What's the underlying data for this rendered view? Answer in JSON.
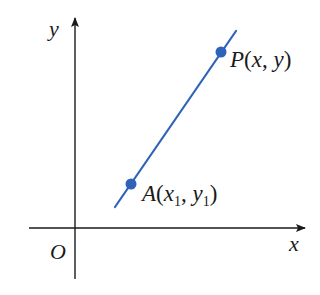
{
  "diagram": {
    "type": "coordinate-plane-line",
    "axes": {
      "x_label": "x",
      "y_label": "y",
      "origin_label": "O",
      "color": "#1a1a1a"
    },
    "line": {
      "color": "#2e63b8",
      "description": "straight line through points A and P with positive slope"
    },
    "points": [
      {
        "id": "A",
        "name": "A",
        "open": "(",
        "x": "x",
        "x_sub": "1",
        "sep": ", ",
        "y": "y",
        "y_sub": "1",
        "close": ")",
        "color": "#2e63b8"
      },
      {
        "id": "P",
        "name": "P",
        "open": "(",
        "x": "x",
        "sep": ", ",
        "y": "y",
        "close": ")",
        "color": "#2e63b8"
      }
    ]
  }
}
